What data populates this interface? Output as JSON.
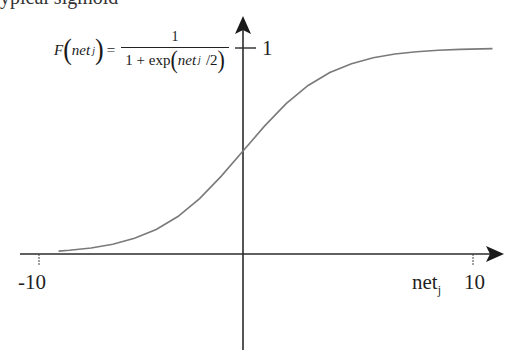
{
  "chart_data": {
    "type": "line",
    "title": "",
    "formula": {
      "lhs_func": "F",
      "lhs_arg": "net",
      "lhs_sub": "j",
      "equals": "=",
      "numerator": "1",
      "den_prefix": "1 + exp",
      "den_arg": "net",
      "den_sub": "j",
      "den_suffix": "/2"
    },
    "xlabel": "net",
    "xlabel_sub": "j",
    "ylabel": "",
    "x_ticks": [
      {
        "value": -10,
        "label": "-10"
      },
      {
        "value": 10,
        "label": "10"
      }
    ],
    "y_ticks": [
      {
        "value": 1,
        "label": "1"
      }
    ],
    "xlim": [
      -10.9,
      11.5
    ],
    "ylim": [
      -0.5,
      1.15
    ],
    "grid": false,
    "legend": null,
    "series": [
      {
        "name": "sigmoid",
        "color": "#7a7a7a",
        "x": [
          -8.5,
          -8,
          -7,
          -6,
          -5,
          -4,
          -3,
          -2,
          -1,
          0,
          1,
          2,
          3,
          4,
          5,
          6,
          7,
          8,
          9,
          10,
          11.5
        ],
        "y": [
          0.014,
          0.018,
          0.029,
          0.047,
          0.076,
          0.119,
          0.182,
          0.269,
          0.378,
          0.5,
          0.622,
          0.731,
          0.818,
          0.881,
          0.924,
          0.953,
          0.971,
          0.982,
          0.989,
          0.993,
          0.997
        ]
      }
    ]
  },
  "clipped_caption": "ypical sigmoid",
  "colors": {
    "axis": "#2b2b2b",
    "curve": "#7a7a7a",
    "text": "#1f1f1f"
  }
}
